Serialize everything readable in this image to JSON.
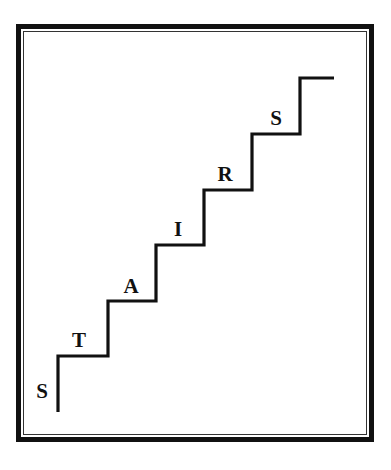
{
  "diagram": {
    "title": "",
    "word": "STAIRS",
    "colors": {
      "line": "#111111",
      "background": "#ffffff",
      "frame": "#111111"
    },
    "stair_path_points": [
      [
        58,
        412
      ],
      [
        58,
        356
      ],
      [
        108,
        356
      ],
      [
        108,
        301
      ],
      [
        156,
        301
      ],
      [
        156,
        245
      ],
      [
        204,
        245
      ],
      [
        204,
        190
      ],
      [
        252,
        190
      ],
      [
        252,
        134
      ],
      [
        300,
        134
      ],
      [
        300,
        78
      ],
      [
        334,
        78
      ]
    ],
    "letters": [
      {
        "char": "S",
        "x": 42,
        "y": 381
      },
      {
        "char": "T",
        "x": 79,
        "y": 330
      },
      {
        "char": "A",
        "x": 131,
        "y": 276
      },
      {
        "char": "I",
        "x": 178,
        "y": 219
      },
      {
        "char": "R",
        "x": 225,
        "y": 164
      },
      {
        "char": "S",
        "x": 276,
        "y": 108
      }
    ]
  }
}
